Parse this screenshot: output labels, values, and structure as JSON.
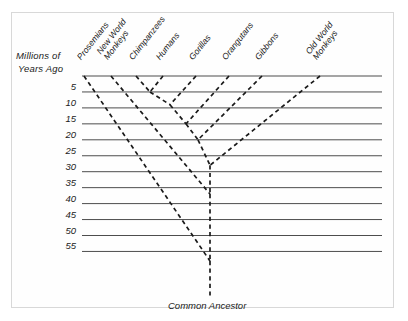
{
  "figure": {
    "kind": "phylogenetic-tree",
    "axis_title_line1": "Millions of",
    "axis_title_line2": "Years  Ago",
    "root_label": "Common Ancestor",
    "background_color": "#ffffff",
    "gridline_color": "#4d4d4d",
    "branch_color": "#1a1a1a",
    "frame_color": "#d8d8d8"
  },
  "chart_data": {
    "type": "line",
    "title": "",
    "xlabel": "",
    "ylabel": "Millions of Years Ago",
    "ylim": [
      0,
      60
    ],
    "grid": true,
    "legend": "none",
    "axis_direction": "inverted-y-time-before-present",
    "tick_values": [
      5,
      10,
      15,
      20,
      25,
      30,
      35,
      40,
      45,
      50,
      55
    ],
    "tick_labels": [
      "5",
      "10",
      "15",
      "20",
      "25",
      "30",
      "35",
      "40",
      "45",
      "50",
      "55"
    ],
    "taxa": [
      {
        "name": "Prosemians",
        "label": "Prosemians",
        "tip_x": 84,
        "divergence_mya": 58
      },
      {
        "name": "New World Monkeys",
        "label": "New World\nMonkeys",
        "tip_x": 111,
        "divergence_mya": 37
      },
      {
        "name": "Chimpanzees",
        "label": "Chimpanzees",
        "tip_x": 136,
        "divergence_mya": 5
      },
      {
        "name": "Humans",
        "label": "Humans",
        "tip_x": 163,
        "divergence_mya": 5
      },
      {
        "name": "Gorillas",
        "label": "Gorillas",
        "tip_x": 196,
        "divergence_mya": 9
      },
      {
        "name": "Orangutans",
        "label": "Orangutans",
        "tip_x": 229,
        "divergence_mya": 15
      },
      {
        "name": "Gibbons",
        "label": "Gibbons",
        "tip_x": 262,
        "divergence_mya": 20
      },
      {
        "name": "Old World Monkeys",
        "label": "Old World\nMonkeys",
        "tip_x": 320,
        "divergence_mya": 28
      }
    ],
    "nodes": [
      {
        "id": "chimp-human",
        "mya": 5,
        "children": [
          "Chimpanzees",
          "Humans"
        ]
      },
      {
        "id": "gorilla-clade",
        "mya": 9,
        "children": [
          "chimp-human",
          "Gorillas"
        ]
      },
      {
        "id": "orangutan-clade",
        "mya": 15,
        "children": [
          "gorilla-clade",
          "Orangutans"
        ]
      },
      {
        "id": "gibbon-clade",
        "mya": 20,
        "children": [
          "orangutan-clade",
          "Gibbons"
        ]
      },
      {
        "id": "old-world-clade",
        "mya": 28,
        "children": [
          "gibbon-clade",
          "Old World Monkeys"
        ]
      },
      {
        "id": "new-world-clade",
        "mya": 37,
        "children": [
          "old-world-clade",
          "New World Monkeys"
        ]
      },
      {
        "id": "common-ancestor",
        "mya": 58,
        "children": [
          "new-world-clade",
          "Prosemians"
        ]
      }
    ]
  }
}
